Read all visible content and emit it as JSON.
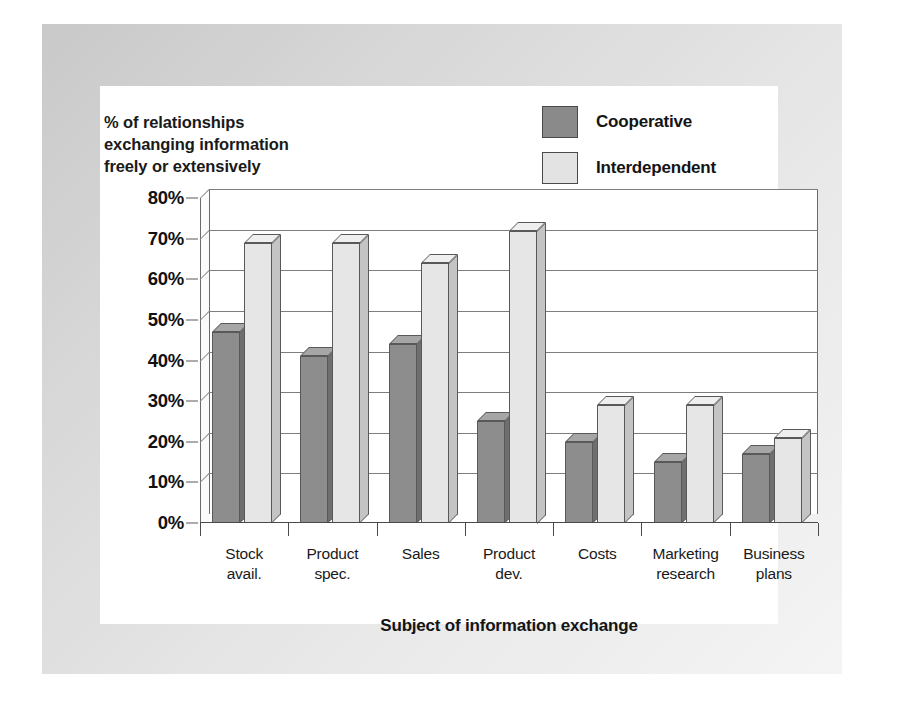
{
  "chart_data": {
    "type": "bar",
    "title": "",
    "ylabel": "% of relationships exchanging information freely or extensively",
    "xlabel": "Subject of information exchange",
    "categories": [
      "Stock avail.",
      "Product spec.",
      "Sales",
      "Product dev.",
      "Costs",
      "Marketing research",
      "Business plans"
    ],
    "category_lines": [
      [
        "Stock",
        "avail."
      ],
      [
        "Product",
        "spec."
      ],
      [
        "Sales",
        ""
      ],
      [
        "Product",
        "dev."
      ],
      [
        "Costs",
        ""
      ],
      [
        "Marketing",
        "research"
      ],
      [
        "Business",
        "plans"
      ]
    ],
    "series": [
      {
        "name": "Cooperative",
        "color": "#8d8d8d",
        "values": [
          47,
          41,
          44,
          25,
          20,
          15,
          17
        ]
      },
      {
        "name": "Interdependent",
        "color": "#e6e6e6",
        "values": [
          69,
          69,
          64,
          72,
          29,
          29,
          21
        ]
      }
    ],
    "ylim": [
      0,
      80
    ],
    "ytick_values": [
      0,
      10,
      20,
      30,
      40,
      50,
      60,
      70,
      80
    ],
    "ytick_labels": [
      "0%",
      "10%",
      "20%",
      "30%",
      "40%",
      "50%",
      "60%",
      "70%",
      "80%"
    ],
    "grid": true,
    "legend_position": "top-right",
    "style": "3d-column"
  },
  "ylabel_lines": [
    "% of relationships",
    "exchanging information",
    "freely or extensively"
  ],
  "legend": {
    "items": [
      {
        "label": "Cooperative",
        "swatch": "dark-gray-swatch"
      },
      {
        "label": "Interdependent",
        "swatch": "light-gray-swatch"
      }
    ]
  },
  "xaxis_title": "Subject of information exchange"
}
